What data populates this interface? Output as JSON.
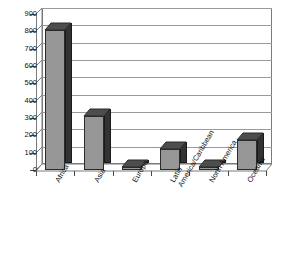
{
  "chart_data": {
    "type": "bar",
    "title": "",
    "subtitle": "",
    "xlabel": "",
    "ylabel": "",
    "categories": [
      "Africa",
      "Asia",
      "Europe",
      "Latin America/Caribbean",
      "North America",
      "Oceania"
    ],
    "category_lines": [
      [
        "Africa"
      ],
      [
        "Asia"
      ],
      [
        "Europe"
      ],
      [
        "Latin",
        "America/Caribbean"
      ],
      [
        "North America"
      ],
      [
        "Oceania"
      ]
    ],
    "values": [
      810,
      310,
      12,
      120,
      10,
      172
    ],
    "ylim": [
      0,
      900
    ],
    "ytick_step": 100,
    "yticks": [
      0,
      100,
      200,
      300,
      400,
      500,
      600,
      700,
      800,
      900
    ],
    "ytick_labels": [
      "0",
      "100",
      "200",
      "300",
      "400",
      "500",
      "600",
      "700",
      "800",
      "900"
    ],
    "grid": true,
    "legend": false,
    "legend_position": "none",
    "style": "3d-column",
    "series": [
      {
        "name": "",
        "values": [
          810,
          310,
          12,
          120,
          10,
          172
        ]
      }
    ]
  },
  "colors": {
    "background": "#ffffff",
    "bar_front": "#969696",
    "bar_top": "#4d4d4d",
    "bar_side": "#333333",
    "bar_outline": "#2b2b2b",
    "gridline": "#9a9a9a",
    "axis": "#7a7a7a",
    "text": "#111111",
    "floor": "#ffffff",
    "wall": "#ffffff"
  }
}
